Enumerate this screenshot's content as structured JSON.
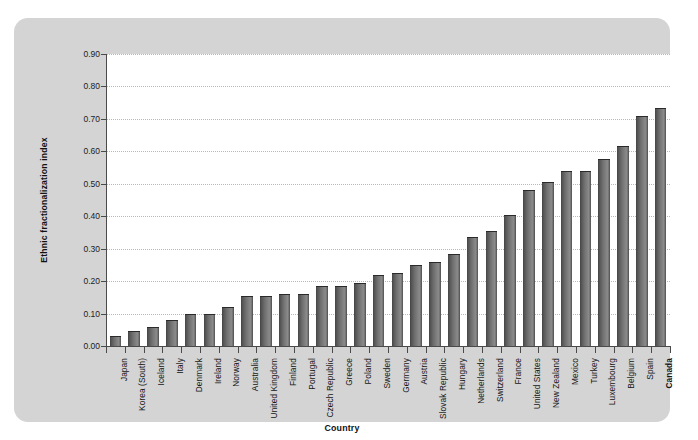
{
  "chart_data": {
    "type": "bar",
    "title": "",
    "xlabel": "Country",
    "ylabel": "Ethnic fractionalization index",
    "ylim": [
      0.0,
      0.9
    ],
    "ytick_labels": [
      "0.90",
      "0.80",
      "0.70",
      "0.60",
      "0.50",
      "0.40",
      "0.30",
      "0.20",
      "0.10",
      "0.00"
    ],
    "ytick_values": [
      0.9,
      0.8,
      0.7,
      0.6,
      0.5,
      0.4,
      0.3,
      0.2,
      0.1,
      0.0
    ],
    "grid": true,
    "legend": "none",
    "highlight_category": "Canada",
    "categories": [
      "Japan",
      "Korea (South)",
      "Iceland",
      "Italy",
      "Denmark",
      "Ireland",
      "Norway",
      "Australia",
      "United Kingdom",
      "Finland",
      "Portugal",
      "Czech Republic",
      "Greece",
      "Poland",
      "Sweden",
      "Germany",
      "Austria",
      "Slovak Republic",
      "Hungary",
      "Netherlands",
      "Switzerland",
      "France",
      "United States",
      "New Zealand",
      "Mexico",
      "Turkey",
      "Luxembourg",
      "Belgium",
      "Spain",
      "Canada"
    ],
    "values": [
      0.03,
      0.045,
      0.06,
      0.08,
      0.1,
      0.1,
      0.12,
      0.155,
      0.155,
      0.16,
      0.16,
      0.185,
      0.185,
      0.195,
      0.22,
      0.225,
      0.25,
      0.26,
      0.285,
      0.335,
      0.355,
      0.405,
      0.48,
      0.505,
      0.54,
      0.54,
      0.575,
      0.615,
      0.71,
      0.735
    ]
  },
  "colors": {
    "panel_background": "#d4d4d4",
    "plot_background": "#ffffff",
    "bar_dark": "#3d3d3d",
    "bar_light": "#8a8a8a",
    "axis": "#4a4a4a",
    "gridline": "#b9b9b9",
    "text": "#141414"
  }
}
